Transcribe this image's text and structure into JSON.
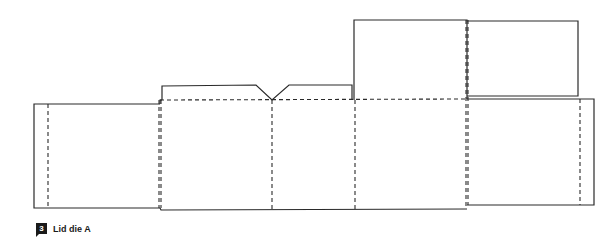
{
  "figure": {
    "number": "3",
    "caption": "Lid die A",
    "colors": {
      "line": "#2a2a2a",
      "background": "#ffffff"
    }
  },
  "dieline": {
    "cut_lines": "solid",
    "fold_lines": "dashed",
    "panels": [
      {
        "name": "left-glue-panel",
        "x": 34,
        "y": 104,
        "w": 126,
        "h": 104
      },
      {
        "name": "front-panel",
        "x": 160,
        "y": 100,
        "w": 112,
        "h": 110
      },
      {
        "name": "middle-panel",
        "x": 272,
        "y": 100,
        "w": 83,
        "h": 110
      },
      {
        "name": "back-panel",
        "x": 355,
        "y": 100,
        "w": 112,
        "h": 110
      },
      {
        "name": "right-panel",
        "x": 467,
        "y": 99,
        "w": 127,
        "h": 106
      },
      {
        "name": "top-tab-with-notch",
        "x": 162,
        "y": 85,
        "w": 190,
        "h": 15
      },
      {
        "name": "upper-flap",
        "x": 354,
        "y": 20,
        "w": 113,
        "h": 80
      },
      {
        "name": "far-upper-flap",
        "x": 467,
        "y": 22,
        "w": 111,
        "h": 75
      }
    ]
  }
}
